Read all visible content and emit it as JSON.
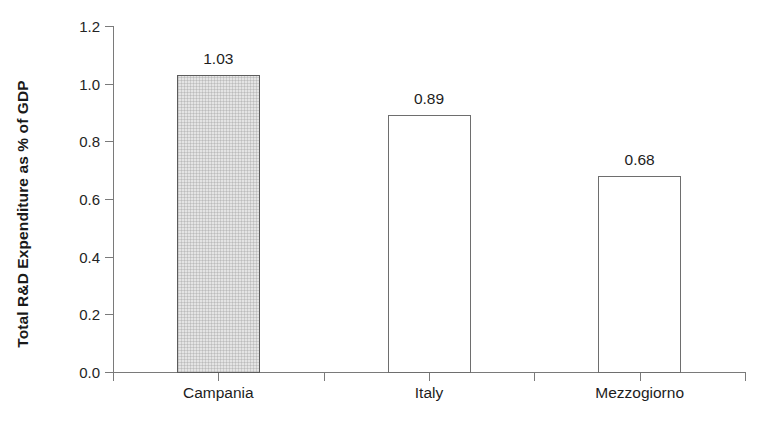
{
  "chart_data": {
    "type": "bar",
    "title": "",
    "subtitle": "",
    "xlabel": "",
    "ylabel": "Total R&D Expenditure as % of GDP",
    "categories": [
      "Campania",
      "Italy",
      "Mezzogiorno"
    ],
    "values": [
      1.03,
      0.89,
      0.68
    ],
    "value_labels": [
      "1.03",
      "0.89",
      "0.68"
    ],
    "ylim": [
      0.0,
      1.2
    ],
    "ytick_values": [
      1.2,
      1.0,
      0.8,
      0.6,
      0.4,
      0.2,
      0.0
    ],
    "ytick_labels": [
      "1.2",
      "1.0",
      "0.8",
      "0.6",
      "0.4",
      "0.2",
      "0.0"
    ],
    "grid": false,
    "legend": false,
    "legend_position": "none",
    "series": [
      {
        "name": "Total R&D Expenditure as % of GDP",
        "values": [
          1.03,
          0.89,
          0.68
        ]
      }
    ],
    "bar_styles": [
      {
        "category": "Campania",
        "fill": "#e4e4e4",
        "pattern": "crosshatch-dotted",
        "border": "#5c5c5c"
      },
      {
        "category": "Italy",
        "fill": "#ffffff",
        "pattern": "none",
        "border": "#6e6e6e"
      },
      {
        "category": "Mezzogiorno",
        "fill": "#ffffff",
        "pattern": "none",
        "border": "#6e6e6e"
      }
    ],
    "axis_color": "#7a7a7a",
    "text_color": "#1d1d1d",
    "background": "#ffffff"
  }
}
